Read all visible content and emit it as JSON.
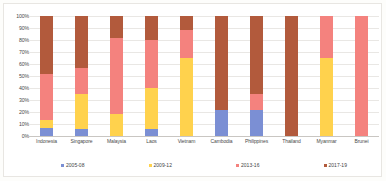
{
  "chart_data": {
    "type": "bar",
    "title": "",
    "subtitle": "",
    "xlabel": "",
    "ylabel": "",
    "stacked": true,
    "stack_mode": "percent",
    "grid": true,
    "legend_position": "bottom",
    "ylim": [
      0,
      100
    ],
    "ytick_labels": [
      "100%",
      "90%",
      "80%",
      "70%",
      "60%",
      "50%",
      "40%",
      "30%",
      "20%",
      "10%",
      "0%"
    ],
    "ytick_values": [
      100,
      90,
      80,
      70,
      60,
      50,
      40,
      30,
      20,
      10,
      0
    ],
    "categories": [
      "Indonesia",
      "Singapore",
      "Malaysia",
      "Laos",
      "Vietnam",
      "Cambodia",
      "Philippines",
      "Thailand",
      "Myanmar",
      "Brunei"
    ],
    "series": [
      {
        "name": "2005-08",
        "color": "#7B8FD4",
        "values": [
          7,
          6,
          0,
          6,
          0,
          22,
          22,
          0,
          0,
          0
        ]
      },
      {
        "name": "2009-12",
        "color": "#FFD24D",
        "values": [
          6,
          29,
          18,
          34,
          65,
          0,
          0,
          0,
          65,
          0
        ]
      },
      {
        "name": "2013-16",
        "color": "#F4827E",
        "values": [
          39,
          22,
          64,
          40,
          23,
          0,
          13,
          0,
          35,
          100
        ]
      },
      {
        "name": "2017-19",
        "color": "#B25A3C",
        "values": [
          48,
          43,
          18,
          20,
          12,
          78,
          65,
          100,
          0,
          0
        ]
      }
    ]
  },
  "axis": {
    "y_max_label": "100%",
    "y_min_label": "0%"
  },
  "colors": {
    "blue_2005_08": "#7B8FD4",
    "yellow_2009_12": "#FFD24D",
    "salmon_2013_16": "#F4827E",
    "brown_2017_19": "#B25A3C",
    "gridline": "#e9e7e4",
    "axis_text": "#4a4a4a",
    "background": "#ffffff"
  }
}
